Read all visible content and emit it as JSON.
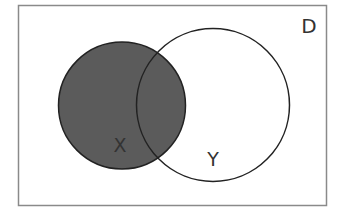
{
  "diagram": {
    "type": "venn",
    "universe": {
      "label": "D",
      "x": 18.5,
      "y": 5.5,
      "width": 308,
      "height": 200,
      "stroke": "#8a8a8a"
    },
    "sets": [
      {
        "label": "X",
        "cx": 122,
        "cy": 105.5,
        "r": 63.5,
        "fill": "#5b5b5b",
        "shaded": true,
        "label_x": 120,
        "label_y": 152
      },
      {
        "label": "Y",
        "cx": 213,
        "cy": 105,
        "r": 76.5,
        "fill": "none",
        "shaded": false,
        "label_x": 213,
        "label_y": 166
      }
    ],
    "shaded_region": "X",
    "colors": {
      "shade": "#5b5b5b",
      "outline": "#222222",
      "text": "#333333"
    }
  }
}
